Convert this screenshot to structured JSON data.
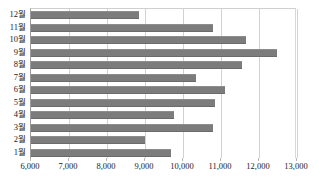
{
  "chart_data": {
    "type": "bar",
    "orientation": "horizontal",
    "title": "",
    "xlabel": "",
    "ylabel": "",
    "categories": [
      "12월",
      "11월",
      "10월",
      "9월",
      "8월",
      "7월",
      "6월",
      "5월",
      "4월",
      "3월",
      "2월",
      "1월"
    ],
    "values": [
      8840,
      10790,
      11650,
      12470,
      11550,
      10340,
      11100,
      10840,
      9760,
      10790,
      9000,
      9680
    ],
    "xlim": [
      6000,
      13000
    ],
    "xticks": [
      6000,
      7000,
      8000,
      9000,
      10000,
      11000,
      12000,
      13000
    ],
    "xtick_labels": [
      "6,000",
      "7,000",
      "8,000",
      "9,000",
      "10,000",
      "11,000",
      "12,000",
      "13,000"
    ],
    "grid": true,
    "grid_axis": "x",
    "legend": false,
    "series": [
      {
        "name": "",
        "color": "#7c7c7c",
        "values": [
          8840,
          10790,
          11650,
          12470,
          11550,
          10340,
          11100,
          10840,
          9760,
          10790,
          9000,
          9680
        ]
      }
    ]
  },
  "colors": {
    "bar": "#7c7c7c",
    "gridline": "#d2d2d2",
    "axis": "#9a9a9a",
    "text": "#1c1c1c",
    "background": "#ffffff"
  }
}
